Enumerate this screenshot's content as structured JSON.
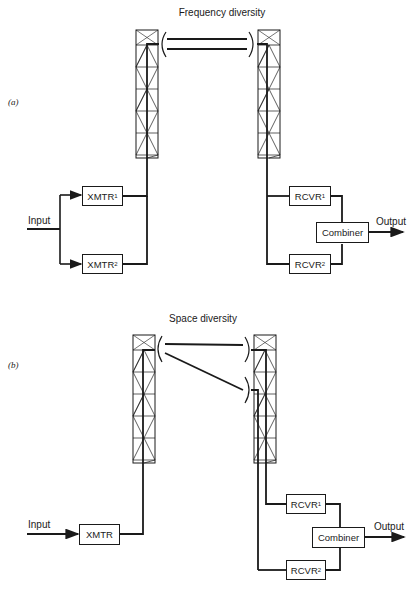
{
  "figure_a": {
    "panel_label": "(a)",
    "title": "Frequency diversity",
    "input_label": "Input",
    "output_label": "Output",
    "blocks": {
      "xmtr1": {
        "name": "XMTR",
        "sub": "1"
      },
      "xmtr2": {
        "name": "XMTR",
        "sub": "2"
      },
      "rcvr1": {
        "name": "RCVR",
        "sub": "1"
      },
      "rcvr2": {
        "name": "RCVR",
        "sub": "2"
      },
      "combiner": "Combiner"
    }
  },
  "figure_b": {
    "panel_label": "(b)",
    "title": "Space diversity",
    "input_label": "Input",
    "output_label": "Output",
    "blocks": {
      "xmtr": "XMTR",
      "rcvr1": {
        "name": "RCVR",
        "sub": "1"
      },
      "rcvr2": {
        "name": "RCVR",
        "sub": "2"
      },
      "combiner": "Combiner"
    }
  },
  "colors": {
    "line": "#1a1a1a",
    "background": "#ffffff"
  }
}
